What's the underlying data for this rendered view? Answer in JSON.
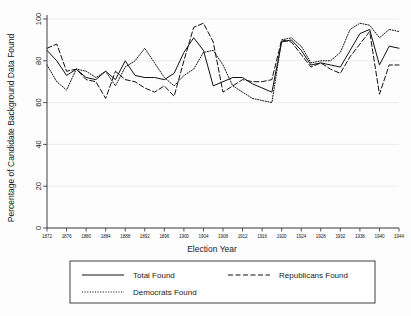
{
  "chart_data": {
    "type": "line",
    "title": "",
    "xlabel": "Election Year",
    "ylabel": "Percentage of Candidate Background Data Found",
    "xlim": [
      1872,
      1944
    ],
    "ylim": [
      0,
      100
    ],
    "yticks": [
      0,
      20,
      40,
      60,
      80,
      100
    ],
    "xticks": [
      1872,
      1876,
      1880,
      1884,
      1888,
      1892,
      1896,
      1900,
      1904,
      1908,
      1912,
      1916,
      1920,
      1924,
      1928,
      1932,
      1936,
      1940,
      1944
    ],
    "xtick_labels": [
      "1872",
      "1876",
      "1880",
      "1884",
      "1888",
      "1892",
      "1896",
      "1900",
      "1904",
      "1908",
      "1912",
      "1916",
      "1920",
      "1924",
      "1928",
      "1932",
      "1936",
      "1940",
      "1944"
    ],
    "ytick_labels": [
      "0",
      "20",
      "40",
      "60",
      "80",
      "100"
    ],
    "grid": true,
    "legend_position": "below-axes",
    "x": [
      1872,
      1874,
      1876,
      1878,
      1880,
      1882,
      1884,
      1886,
      1888,
      1890,
      1892,
      1894,
      1896,
      1898,
      1900,
      1902,
      1904,
      1906,
      1908,
      1910,
      1912,
      1914,
      1916,
      1918,
      1920,
      1922,
      1924,
      1926,
      1928,
      1930,
      1932,
      1934,
      1936,
      1938,
      1940,
      1942,
      1944
    ],
    "series": [
      {
        "name": "Total Found",
        "style": "solid",
        "values": [
          85,
          80,
          73,
          76,
          72,
          71,
          75,
          71,
          80,
          73,
          72,
          72,
          71,
          74,
          84,
          91,
          85,
          68,
          70,
          72,
          72,
          69,
          67,
          65,
          64,
          62,
          58,
          62,
          73,
          79,
          72,
          62,
          59,
          75,
          89,
          90,
          88
        ]
      },
      {
        "name": "Republicans Found",
        "style": "dashed",
        "values": [
          86,
          88,
          75,
          76,
          71,
          70,
          62,
          75,
          71,
          70,
          67,
          65,
          68,
          63,
          80,
          96,
          98,
          89,
          65,
          68,
          71,
          70,
          70,
          71,
          69,
          63,
          59,
          60,
          62,
          65,
          63,
          56,
          60,
          74,
          90,
          90,
          88
        ]
      },
      {
        "name": "Democrats Found",
        "style": "dotted",
        "values": [
          78,
          70,
          66,
          76,
          75,
          72,
          75,
          68,
          77,
          80,
          86,
          79,
          72,
          68,
          73,
          76,
          84,
          85,
          78,
          68,
          65,
          62,
          61,
          60,
          58,
          56,
          57,
          63,
          75,
          89,
          83,
          69,
          58,
          77,
          90,
          91,
          89
        ]
      }
    ],
    "series_tail": {
      "comment_x": [
        1920,
        1922,
        1924,
        1926,
        1928,
        1930,
        1932,
        1934,
        1936,
        1938,
        1940,
        1942,
        1944
      ],
      "total": [
        89,
        90,
        85,
        78,
        79,
        78,
        77,
        85,
        93,
        95,
        78,
        87,
        86
      ],
      "republicans": [
        90,
        89,
        83,
        77,
        79,
        76,
        74,
        82,
        88,
        94,
        64,
        78,
        78
      ],
      "democrats": [
        90,
        91,
        87,
        79,
        80,
        80,
        84,
        95,
        98,
        97,
        91,
        95,
        94
      ]
    }
  },
  "axes": {
    "ylabel": "Percentage of Candidate Background Data Found",
    "xlabel": "Election Year"
  },
  "legend": {
    "entries": [
      {
        "label": "Total Found",
        "style": "solid"
      },
      {
        "label": "Republicans Found",
        "style": "dashed"
      },
      {
        "label": "Democrats Found",
        "style": "dotted"
      }
    ]
  },
  "colors": {
    "line": "#111111",
    "axis": "#2b2b2b",
    "grid": "#e8e8e8",
    "background": "#fdfdfd"
  }
}
